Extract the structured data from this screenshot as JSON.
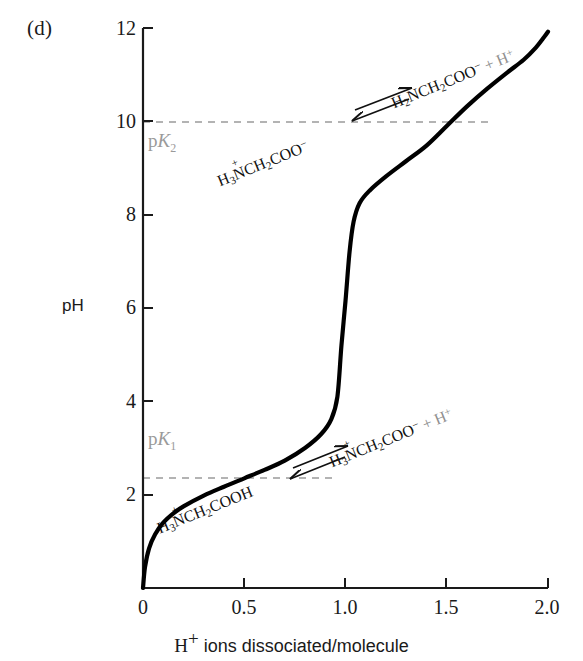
{
  "panel": {
    "label": "(d)"
  },
  "chart_data": {
    "type": "line",
    "title": "",
    "subtitle": "",
    "xlabel": "H+ ions dissociated/molecule",
    "ylabel": "pH",
    "xlim": [
      0,
      2.0
    ],
    "ylim": [
      0,
      12
    ],
    "grid": false,
    "legend": null,
    "x_ticks": [
      "0",
      "0.5",
      "1.0",
      "1.5",
      "2.0"
    ],
    "x_tick_values": [
      0,
      0.5,
      1.0,
      1.5,
      2.0
    ],
    "y_ticks": [
      "2",
      "4",
      "6",
      "8",
      "10",
      "12"
    ],
    "y_tick_values": [
      2,
      4,
      6,
      8,
      10,
      12
    ],
    "series": [
      {
        "name": "glycine titration curve",
        "x": [
          0.0,
          0.01,
          0.03,
          0.06,
          0.1,
          0.15,
          0.2,
          0.3,
          0.4,
          0.5,
          0.6,
          0.7,
          0.8,
          0.88,
          0.93,
          0.96,
          0.98,
          1.0,
          1.02,
          1.04,
          1.07,
          1.12,
          1.2,
          1.3,
          1.4,
          1.5,
          1.6,
          1.7,
          1.8,
          1.88,
          1.94,
          1.98,
          2.0
        ],
        "y": [
          0.0,
          0.45,
          0.85,
          1.15,
          1.4,
          1.6,
          1.75,
          1.98,
          2.17,
          2.35,
          2.53,
          2.73,
          3.0,
          3.3,
          3.62,
          4.1,
          5.2,
          6.15,
          7.2,
          7.85,
          8.25,
          8.52,
          8.82,
          9.15,
          9.48,
          9.9,
          10.32,
          10.7,
          11.05,
          11.32,
          11.58,
          11.8,
          11.92
        ]
      }
    ],
    "reference_lines": [
      {
        "name": "pK1",
        "label": "pK1",
        "value": 2.35,
        "orientation": "horizontal",
        "style": "dashed",
        "color": "#9a9a9a",
        "x_end": 0.95
      },
      {
        "name": "pK2",
        "label": "pK2",
        "value": 9.9,
        "orientation": "horizontal",
        "style": "dashed",
        "color": "#9a9a9a",
        "x_end": 1.72
      }
    ],
    "annotations": [
      {
        "name": "pk1-label",
        "text": "pK1",
        "x": 0.05,
        "y": 2.95
      },
      {
        "name": "pk2-label",
        "text": "pK2",
        "x": 0.07,
        "y": 9.35
      },
      {
        "name": "equation-1-left",
        "text": "H3+NCH2COOH",
        "x": 0.18,
        "y": 1.35
      },
      {
        "name": "equation-1-right",
        "text": "H3+NCH2COO- + H+",
        "x": 0.82,
        "y": 2.95
      },
      {
        "name": "equation-2-left",
        "text": "H3+NCH2COO-",
        "x": 0.33,
        "y": 8.95
      },
      {
        "name": "equation-2-right",
        "text": "H2NCH2COO- + H+",
        "x": 1.13,
        "y": 10.65
      }
    ],
    "equilibrium_arrows": [
      {
        "name": "equilibrium-arrow-1",
        "x": 0.68,
        "y": 2.4
      },
      {
        "name": "equilibrium-arrow-2",
        "x": 1.01,
        "y": 10.05
      }
    ],
    "curve_color": "#000000",
    "axis_color": "#1a1a1a"
  },
  "labels": {
    "pk1": {
      "prefix": "p",
      "italic": "K",
      "sub": "1"
    },
    "pk2": {
      "prefix": "p",
      "italic": "K",
      "sub": "2"
    },
    "y_axis_title": "pH",
    "x_axis_title_prefix": "H",
    "x_axis_title_sup": "+",
    "x_axis_title_rest": " ions dissociated/molecule"
  },
  "equations": {
    "lower": {
      "left": {
        "h": "H",
        "h_sub": "3",
        "n": "N",
        "n_sup": "+",
        "rest": "CH",
        "rest_sub": "2",
        "tail": "COOH"
      },
      "right": {
        "h": "H",
        "h_sub": "3",
        "n": "N",
        "n_sup": "+",
        "rest": "CH",
        "rest_sub": "2",
        "tail": "COO",
        "tail_sup": "−",
        "plus": " + H",
        "plus_sup": "+"
      }
    },
    "upper": {
      "left": {
        "h": "H",
        "h_sub": "3",
        "n": "N",
        "n_sup": "+",
        "rest": "CH",
        "rest_sub": "2",
        "tail": "COO",
        "tail_sup": "−"
      },
      "right": {
        "h": "H",
        "h_sub": "2",
        "n": "N",
        "rest": "CH",
        "rest_sub": "2",
        "tail": "COO",
        "tail_sup": "−",
        "plus": " + H",
        "plus_sup": "+"
      }
    }
  },
  "ticks": {
    "y": [
      {
        "label": "12",
        "value": 12
      },
      {
        "label": "10",
        "value": 10
      },
      {
        "label": "8",
        "value": 8
      },
      {
        "label": "6",
        "value": 6
      },
      {
        "label": "4",
        "value": 4
      },
      {
        "label": "2",
        "value": 2
      }
    ],
    "x": [
      {
        "label": "0",
        "value": 0
      },
      {
        "label": "0.5",
        "value": 0.5
      },
      {
        "label": "1.0",
        "value": 1.0
      },
      {
        "label": "1.5",
        "value": 1.5
      },
      {
        "label": "2.0",
        "value": 2.0
      }
    ]
  },
  "colors": {
    "curve": "#000000",
    "axis": "#1a1a1a",
    "dashed_reference": "#9a9a9a",
    "annotation_grey": "#8f8f8f",
    "text": "#1a1a1a",
    "background": "#ffffff"
  }
}
